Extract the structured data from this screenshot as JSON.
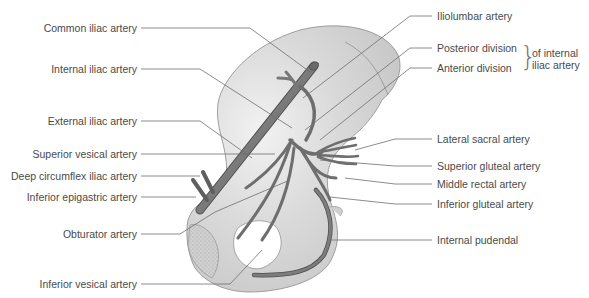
{
  "figure": {
    "colors": {
      "background": "#ffffff",
      "bone_fill": "#d4d4d4",
      "bone_stroke": "#8a8a8a",
      "artery_fill": "#7a7a7a",
      "artery_stroke": "#4f4f4f",
      "leader_line": "#6e6e6e",
      "label_text": "#4a4a4a"
    }
  },
  "labels_left": [
    {
      "id": "common-iliac",
      "text": "Common iliac artery"
    },
    {
      "id": "internal-iliac",
      "text": "Internal iliac artery"
    },
    {
      "id": "external-iliac",
      "text": "External iliac artery"
    },
    {
      "id": "superior-vesical",
      "text": "Superior vesical artery"
    },
    {
      "id": "deep-circumflex-iliac",
      "text": "Deep circumflex iliac artery"
    },
    {
      "id": "inferior-epigastric",
      "text": "Inferior epigastric artery"
    },
    {
      "id": "obturator",
      "text": "Obturator artery"
    },
    {
      "id": "inferior-vesical",
      "text": "Inferior vesical artery"
    }
  ],
  "labels_right": [
    {
      "id": "iliolumbar",
      "text": "Iliolumbar artery"
    },
    {
      "id": "posterior-division",
      "text": "Posterior division"
    },
    {
      "id": "anterior-division",
      "text": "Anterior division"
    },
    {
      "id": "lateral-sacral",
      "text": "Lateral sacral artery"
    },
    {
      "id": "superior-gluteal",
      "text": "Superior gluteal artery"
    },
    {
      "id": "middle-rectal",
      "text": "Middle rectal artery"
    },
    {
      "id": "inferior-gluteal",
      "text": "Inferior gluteal artery"
    },
    {
      "id": "internal-pudendal",
      "text": "Internal pudendal"
    }
  ],
  "division_group": {
    "text_line1": "of internal",
    "text_line2": "iliac artery"
  }
}
